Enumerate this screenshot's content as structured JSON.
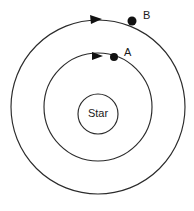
{
  "figure": {
    "kind": "orbit-diagram",
    "background_color": "#ffffff",
    "stroke_color": "#2b2b2b",
    "marker_color": "#111111",
    "text_color": "#1a1a1a"
  },
  "star": {
    "label": "Star",
    "center_x": 98,
    "center_y": 114,
    "radius": 20
  },
  "orbits": [
    {
      "id": "inner-orbit",
      "name": "orbit-A",
      "center_x": 98,
      "center_y": 107,
      "radius": 54,
      "direction": "counterclockwise"
    },
    {
      "id": "outer-orbit",
      "name": "orbit-B",
      "center_x": 98,
      "center_y": 107,
      "radius": 87,
      "direction": "counterclockwise"
    }
  ],
  "bodies": [
    {
      "id": "body-A",
      "label": "A",
      "orbit": "inner-orbit",
      "dot_x": 114,
      "dot_y": 57,
      "dot_radius": 4,
      "label_x": 124,
      "label_y": 53
    },
    {
      "id": "body-B",
      "label": "B",
      "orbit": "outer-orbit",
      "dot_x": 132,
      "dot_y": 21,
      "dot_radius": 4.5,
      "label_x": 143,
      "label_y": 16
    }
  ],
  "arrows": [
    {
      "id": "arrow-A",
      "on_orbit": "inner-orbit",
      "points": "92,52 103,56 92,60",
      "direction": "left"
    },
    {
      "id": "arrow-B",
      "on_orbit": "outer-orbit",
      "points": "90,15 102,19 91,24",
      "direction": "left"
    }
  ]
}
